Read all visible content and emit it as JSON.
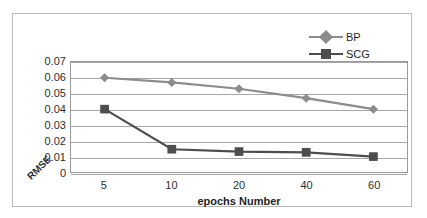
{
  "chart_data": {
    "type": "line",
    "title": "",
    "xlabel": "epochs Number",
    "ylabel": "RMSE",
    "categories": [
      "5",
      "10",
      "20",
      "40",
      "60"
    ],
    "x": [
      5,
      10,
      20,
      40,
      60
    ],
    "ylim": [
      0,
      0.07
    ],
    "yticks": [
      "0.07",
      "0.06",
      "0.05",
      "0.04",
      "0.03",
      "0.02",
      "0.01",
      "0"
    ],
    "ytick_values": [
      0.07,
      0.06,
      0.05,
      0.04,
      0.03,
      0.02,
      0.01,
      0
    ],
    "grid": true,
    "legend_position": "top-right",
    "series": [
      {
        "name": "BP",
        "marker": "diamond",
        "color": "#8c8c8c",
        "values": [
          0.06,
          0.057,
          0.053,
          0.047,
          0.04
        ]
      },
      {
        "name": "SCG",
        "marker": "square",
        "color": "#4d4d4d",
        "values": [
          0.04,
          0.0145,
          0.013,
          0.0125,
          0.0098
        ]
      }
    ]
  },
  "legend": {
    "items": [
      {
        "label": "BP"
      },
      {
        "label": "SCG"
      }
    ]
  },
  "axes": {
    "y_title": "RMSE",
    "y_zero_label": "0",
    "x_title": "epochs Number"
  },
  "colors": {
    "series_bp": "#8c8c8c",
    "series_scg": "#4d4d4d",
    "gridline": "#a6a6a6",
    "frame": "#b9b9b9",
    "text": "#2e2e2e"
  }
}
